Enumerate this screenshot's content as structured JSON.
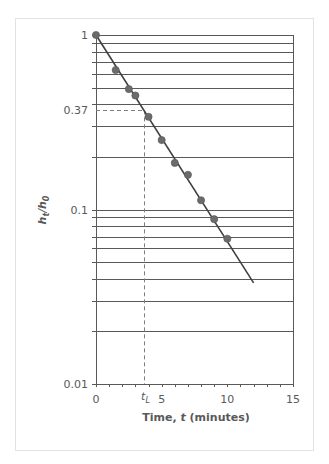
{
  "chart_data": {
    "type": "scatter",
    "title": "",
    "xlabel": "Time, t (minutes)",
    "xlabel_parts": {
      "pre": "Time, ",
      "var": "t",
      "post": " (minutes)"
    },
    "ylabel": "h_t/h_0",
    "ylabel_parts": {
      "h1": "h",
      "sub1": "t",
      "slash": "/",
      "h2": "h",
      "sub2": "0"
    },
    "xlim": [
      0,
      15
    ],
    "ylim": [
      0.01,
      1
    ],
    "yscale": "log",
    "grid": {
      "horizontal": true,
      "vertical": false
    },
    "x_ticks": [
      0,
      5,
      10,
      15
    ],
    "x_tick_labels": [
      "0",
      "5",
      "10",
      "15"
    ],
    "x_minor_step": 1,
    "y_tick_labels": [
      {
        "value": 1,
        "label": "1"
      },
      {
        "value": 0.37,
        "label": "0.37"
      },
      {
        "value": 0.1,
        "label": "0.1"
      },
      {
        "value": 0.01,
        "label": "0.01"
      }
    ],
    "y_gridlines": [
      1,
      0.9,
      0.8,
      0.7,
      0.6,
      0.5,
      0.4,
      0.3,
      0.2,
      0.1,
      0.09,
      0.08,
      0.07,
      0.06,
      0.05,
      0.04,
      0.03,
      0.02
    ],
    "series": [
      {
        "name": "measured",
        "type": "scatter",
        "x": [
          0,
          1.5,
          2.5,
          3.0,
          4.0,
          5.0,
          6.0,
          7.0,
          8.0,
          9.0,
          10.0
        ],
        "y": [
          1.0,
          0.63,
          0.49,
          0.45,
          0.34,
          0.25,
          0.185,
          0.158,
          0.113,
          0.088,
          0.068
        ],
        "color": "#6b6b6b"
      },
      {
        "name": "fit",
        "type": "line",
        "x": [
          0,
          12
        ],
        "y": [
          1.0,
          0.038
        ],
        "color": "#404040"
      }
    ],
    "annotations": [
      {
        "type": "hline-dashed",
        "y": 0.37,
        "x_from": 0,
        "x_to": 3.66
      },
      {
        "type": "vline-dashed",
        "x": 3.66,
        "y_from": 0.37,
        "y_to": 0.01
      },
      {
        "type": "text",
        "x": 3.66,
        "label_main": "t",
        "label_sub": "L"
      }
    ]
  },
  "colors": {
    "grid": "#595959",
    "axis": "#595959",
    "text": "#595959",
    "dashed": "#7f7f7f",
    "frame": "#e2e2e2"
  }
}
